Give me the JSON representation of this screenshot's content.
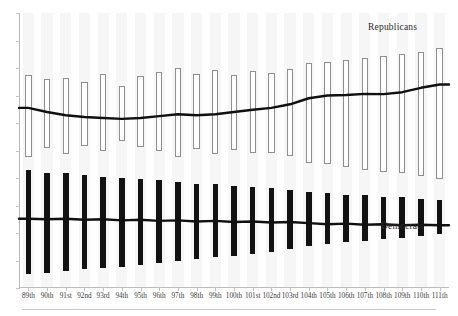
{
  "chart_data": {
    "type": "bar",
    "title": "",
    "subtitle": "",
    "xlabel": "",
    "ylabel": "",
    "grid": "faint vertical bands only, no horizontal gridlines",
    "legend_position": "inline annotations at right of each series",
    "axis": {
      "x_range": [
        "89th",
        "111th"
      ],
      "y_ticks_labeled": false,
      "y_tick_count": 11,
      "y_axis_line": true,
      "x_axis_line": true
    },
    "categories": [
      "89th",
      "90th",
      "91st",
      "92nd",
      "93rd",
      "94th",
      "95th",
      "96th",
      "97th",
      "98th",
      "99th",
      "100th",
      "101st",
      "102nd",
      "103rd",
      "104th",
      "105th",
      "106th",
      "107th",
      "108th",
      "109th",
      "110th",
      "111th"
    ],
    "series": [
      {
        "name": "Republicans",
        "style": "hollow-white-bar",
        "range_low": [
          0.478,
          0.51,
          0.488,
          0.516,
          0.497,
          0.536,
          0.513,
          0.5,
          0.477,
          0.507,
          0.489,
          0.503,
          0.49,
          0.492,
          0.48,
          0.456,
          0.452,
          0.44,
          0.43,
          0.423,
          0.42,
          0.409,
          0.397
        ],
        "range_high": [
          0.775,
          0.76,
          0.762,
          0.75,
          0.778,
          0.735,
          0.77,
          0.785,
          0.8,
          0.78,
          0.792,
          0.776,
          0.788,
          0.783,
          0.795,
          0.818,
          0.822,
          0.83,
          0.838,
          0.845,
          0.85,
          0.86,
          0.872
        ],
        "median": [
          0.655,
          0.64,
          0.628,
          0.622,
          0.618,
          0.615,
          0.618,
          0.625,
          0.632,
          0.628,
          0.632,
          0.64,
          0.648,
          0.655,
          0.668,
          0.69,
          0.7,
          0.702,
          0.706,
          0.705,
          0.712,
          0.728,
          0.74
        ]
      },
      {
        "name": "Democrats",
        "style": "solid-black-bar",
        "range_low": [
          0.05,
          0.055,
          0.062,
          0.068,
          0.072,
          0.078,
          0.085,
          0.09,
          0.098,
          0.105,
          0.112,
          0.118,
          0.125,
          0.132,
          0.14,
          0.152,
          0.16,
          0.168,
          0.172,
          0.178,
          0.182,
          0.188,
          0.195
        ],
        "range_high": [
          0.43,
          0.42,
          0.418,
          0.412,
          0.405,
          0.4,
          0.398,
          0.392,
          0.385,
          0.38,
          0.378,
          0.372,
          0.368,
          0.362,
          0.358,
          0.348,
          0.345,
          0.34,
          0.338,
          0.332,
          0.33,
          0.325,
          0.32
        ],
        "median": [
          0.252,
          0.25,
          0.252,
          0.248,
          0.25,
          0.246,
          0.248,
          0.244,
          0.246,
          0.242,
          0.244,
          0.24,
          0.242,
          0.238,
          0.24,
          0.236,
          0.232,
          0.234,
          0.23,
          0.232,
          0.228,
          0.23,
          0.228
        ]
      }
    ],
    "annotations": [
      {
        "text": "Republicans",
        "series": "Republicans"
      },
      {
        "text": "Democrats",
        "series": "Democrats"
      }
    ],
    "colors": {
      "republican_bar_fill": "#ffffff",
      "republican_bar_stroke": "#8e8e8e",
      "democrat_bar_fill": "#121212",
      "trend_line": "#101010",
      "axis": "#bdbdbd",
      "band": "#f6f6f6",
      "text": "#2b2b2b"
    }
  },
  "labels": {
    "republicans": "Republicans",
    "democrats": "Democrats"
  }
}
